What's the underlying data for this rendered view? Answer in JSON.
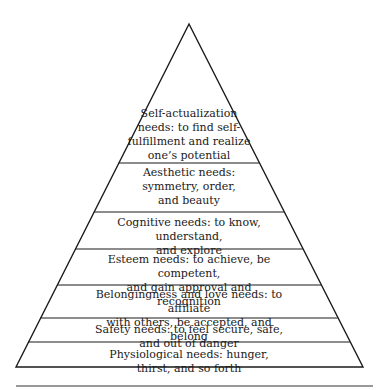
{
  "diagram": {
    "type": "pyramid",
    "stroke_color": "#1a1a1a",
    "background": "#ffffff",
    "tiers": [
      {
        "level": 7,
        "text": "Self-actualization\nneeds: to find self-\nfulfillment and realize\none’s potential"
      },
      {
        "level": 6,
        "text": "Aesthetic needs:\nsymmetry, order,\nand beauty"
      },
      {
        "level": 5,
        "text": "Cognitive needs: to know, understand,\nand explore"
      },
      {
        "level": 4,
        "text": "Esteem needs: to achieve, be competent,\nand gain approval and recognition"
      },
      {
        "level": 3,
        "text": "Belongingness and love needs: to affiliate\nwith others, be accepted, and belong"
      },
      {
        "level": 2,
        "text": "Safety needs: to feel secure, safe, and out of danger"
      },
      {
        "level": 1,
        "text": "Physiological needs: hunger, thirst, and so forth"
      }
    ]
  }
}
